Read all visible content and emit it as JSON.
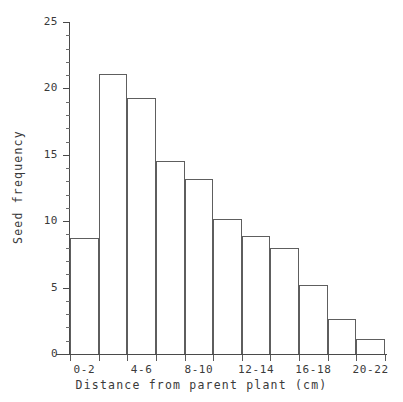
{
  "chart_data": {
    "type": "bar",
    "title": "",
    "subtitle": "",
    "xlabel": "Distance from parent plant (cm)",
    "ylabel": "Seed frequency",
    "categories": [
      "0-2",
      "2-4",
      "4-6",
      "6-8",
      "8-10",
      "10-12",
      "12-14",
      "14-16",
      "16-18",
      "18-20",
      "20-22"
    ],
    "values": [
      8.7,
      21.1,
      19.3,
      14.5,
      13.2,
      10.2,
      8.9,
      8.0,
      5.2,
      2.6,
      1.1
    ],
    "visible_tick_labels": [
      "0-2",
      "4-6",
      "8-10",
      "12-14",
      "16-18",
      "20-22"
    ],
    "visible_tick_label_indices": [
      0,
      2,
      4,
      6,
      8,
      10
    ],
    "ylim": [
      0,
      25
    ],
    "ytick_labels": [
      "0",
      "5",
      "10",
      "15",
      "20",
      "25"
    ],
    "ytick_values": [
      0,
      5,
      10,
      15,
      20,
      25
    ],
    "yminor_tick_values": [
      1,
      2,
      3,
      4,
      6,
      7,
      8,
      9,
      11,
      12,
      13,
      14,
      16,
      17,
      18,
      19,
      21,
      22,
      23,
      24
    ],
    "grid": false,
    "legend": null,
    "legend_position": "none",
    "bar_fill_color": "#ffffff",
    "bar_edge_color": "#5e5e5e",
    "axis_color": "#4a4a4a",
    "text_color": "#3a3a3a",
    "background_color": "#ffffff"
  }
}
